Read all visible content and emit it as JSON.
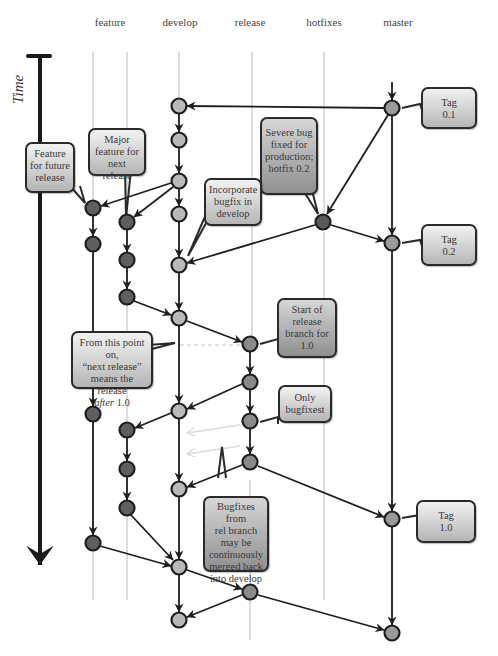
{
  "columns": {
    "feature": {
      "label": "feature",
      "x": 110
    },
    "develop": {
      "label": "develop",
      "x": 180
    },
    "release": {
      "label": "release",
      "x": 250
    },
    "hotfixes": {
      "label": "hotfixes",
      "x": 324
    },
    "master": {
      "label": "master",
      "x": 398
    }
  },
  "axis": {
    "label": "Time"
  },
  "colors": {
    "develop_node": "#b9b9b9",
    "feature_node": "#5f5f5f",
    "release_node": "#8a8a8a",
    "hotfix_node": "#5a5a5a",
    "master_node": "#9a9a9a",
    "node_stroke": "#1e1e1e",
    "edge": "#1e1e1e",
    "lane": "#d8d8d8",
    "faded_arrow": "#e0e0e0"
  },
  "callouts": {
    "tag_01": {
      "lines": [
        "Tag",
        "0.1"
      ]
    },
    "tag_02": {
      "lines": [
        "Tag",
        "0.2"
      ]
    },
    "tag_10": {
      "lines": [
        "Tag",
        "1.0"
      ]
    },
    "feature_future": {
      "lines": [
        "Feature",
        "for future",
        "release"
      ]
    },
    "major_feature": {
      "lines": [
        "Major",
        "feature for",
        "next release"
      ]
    },
    "severe_bug": {
      "lines": [
        "Severe bug",
        "fixed for",
        "production;",
        "hotfix 0.2"
      ]
    },
    "incorporate_bugfix": {
      "lines": [
        "Incorporate",
        "bugfix in",
        "develop"
      ]
    },
    "start_release": {
      "lines": [
        "Start of",
        "release",
        "branch for",
        "1.0"
      ]
    },
    "next_release": {
      "lines": [
        "From this point on,",
        "“next release”",
        "means the release"
      ],
      "last_italic": "after",
      "last_rest": " 1.0"
    },
    "only_bugfixes": {
      "lines": [
        "Only",
        "bugfixest"
      ]
    },
    "bugfixes_merged": {
      "lines": [
        "Bugfixes from",
        "rel branch",
        "may be",
        "continuously",
        "merged back",
        "into develop"
      ]
    }
  }
}
